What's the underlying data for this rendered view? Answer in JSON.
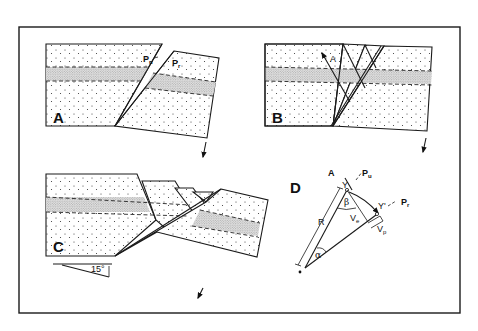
{
  "figure": {
    "panels": [
      {
        "id": "A",
        "label": "A",
        "annotations": {
          "upper_plate": "P",
          "upper_plate_sub": "u",
          "rotated_plate": "P",
          "rotated_plate_sub": "r"
        }
      },
      {
        "id": "B",
        "label": "B",
        "annotations": {
          "fault_marker": "A"
        }
      },
      {
        "id": "C",
        "label": "C",
        "annotations": {
          "angle": "15°"
        }
      },
      {
        "id": "D",
        "label": "D",
        "annotations": {
          "point_a": "A",
          "pu": "P",
          "pu_sub": "u",
          "pr": "P",
          "pr_sub": "r",
          "y": "Y",
          "y_prime": "Y'",
          "beta": "β",
          "alpha": "α",
          "radius": "R",
          "ve": "V",
          "ve_sub": "e",
          "vp": "V",
          "vp_sub": "p"
        }
      }
    ],
    "colors": {
      "ink": "#1a1a1a",
      "background": "#ffffff"
    }
  }
}
